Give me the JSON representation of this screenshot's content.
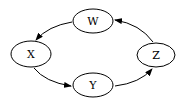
{
  "diagram": {
    "type": "directed-cycle",
    "nodes": [
      {
        "id": "W",
        "label": "W",
        "cx": 93,
        "cy": 21,
        "rx": 20,
        "ry": 12
      },
      {
        "id": "X",
        "label": "X",
        "cx": 31,
        "cy": 54,
        "rx": 20,
        "ry": 13
      },
      {
        "id": "Y",
        "label": "Y",
        "cx": 93,
        "cy": 85,
        "rx": 20,
        "ry": 12
      },
      {
        "id": "Z",
        "label": "Z",
        "cx": 156,
        "cy": 55,
        "rx": 19,
        "ry": 12
      }
    ],
    "edges": [
      {
        "from": "W",
        "to": "X"
      },
      {
        "from": "X",
        "to": "Y"
      },
      {
        "from": "Y",
        "to": "Z"
      },
      {
        "from": "Z",
        "to": "W"
      }
    ],
    "colors": {
      "stroke": "#000000",
      "fill": "#ffffff",
      "background": "#ffffff"
    }
  }
}
